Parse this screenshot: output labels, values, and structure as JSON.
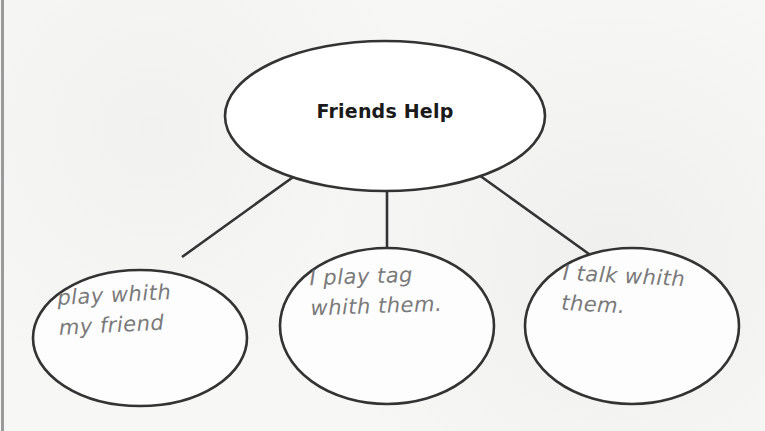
{
  "diagram": {
    "type": "web / bubble map",
    "stroke_color": "#333333",
    "background_color": "#f7f7f6",
    "center_node": {
      "label": "Friends Help"
    },
    "child_nodes": [
      {
        "label": "play whith\nmy friend"
      },
      {
        "label": "I play tag\nwhith them."
      },
      {
        "label": "I talk whith\nthem."
      }
    ],
    "handwriting_color": "#7a7a7a"
  }
}
